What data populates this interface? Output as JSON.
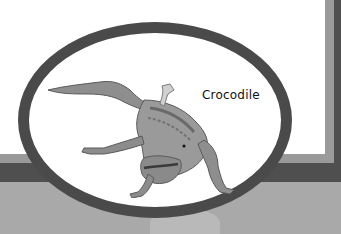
{
  "card": {
    "label": "Crocodile",
    "image_subject": "crocodile",
    "colors": {
      "background": "#ffffff",
      "frame_dark": "#4f4f4f",
      "frame_light": "#9a9a9a",
      "band": "#a9a9a9",
      "ellipse_border": "#4a4a4a"
    }
  }
}
